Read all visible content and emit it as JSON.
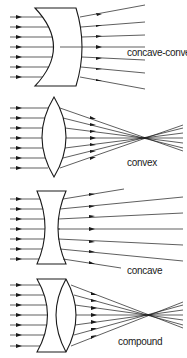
{
  "figure": {
    "panels": [
      {
        "id": "concave-convex",
        "label": "concave-convex",
        "behavior": "diverging"
      },
      {
        "id": "convex",
        "label": "convex",
        "behavior": "converging"
      },
      {
        "id": "concave",
        "label": "concave",
        "behavior": "diverging"
      },
      {
        "id": "compound",
        "label": "compound",
        "behavior": "converging"
      }
    ],
    "incoming_rays_per_panel": 7,
    "colors": {
      "ink": "#1a1a1a",
      "background": "#ffffff"
    }
  }
}
